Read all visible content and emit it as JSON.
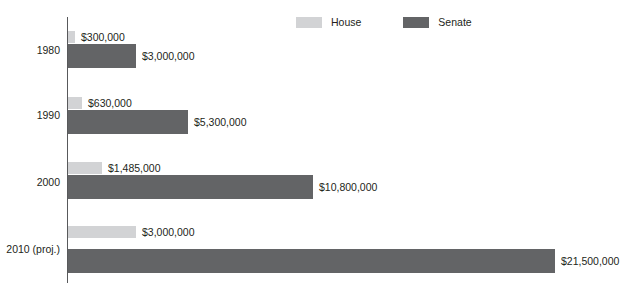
{
  "legend": {
    "position": "top-center",
    "entries": [
      {
        "label": "House",
        "color": "#d2d3d5",
        "swatch_name": "house-swatch"
      },
      {
        "label": "Senate",
        "color": "#636466",
        "swatch_name": "senate-swatch"
      }
    ]
  },
  "axis": {
    "line_color": "#58595b"
  },
  "colors": {
    "house": "#d2d3d5",
    "senate": "#636466",
    "text": "#231f20"
  },
  "chart_data": {
    "type": "bar",
    "orientation": "horizontal",
    "title": "",
    "subtitle": "",
    "xlabel": "",
    "ylabel": "",
    "grid": false,
    "legend_position": "top-center",
    "categories": [
      "1980",
      "1990",
      "2000",
      "2010 (proj.)"
    ],
    "series": [
      {
        "name": "House",
        "color": "#d2d3d5",
        "values": [
          300000,
          630000,
          1485000,
          3000000
        ],
        "value_labels": [
          "$300,000",
          "$630,000",
          "$1,485,000",
          "$3,000,000"
        ]
      },
      {
        "name": "Senate",
        "color": "#636466",
        "values": [
          3000000,
          5300000,
          10800000,
          21500000
        ],
        "value_labels": [
          "$3,000,000",
          "$5,300,000",
          "$10,800,000",
          "$21,500,000"
        ]
      }
    ],
    "xlim": [
      0,
      21500000
    ],
    "value_prefix": "$"
  },
  "groups": [
    {
      "category": "1980",
      "top": 30,
      "label_top": 44,
      "house": {
        "top": 31,
        "width": 7,
        "value": "$300,000"
      },
      "senate": {
        "top": 44,
        "width": 68,
        "value": "$3,000,000"
      }
    },
    {
      "category": "1990",
      "top": 99,
      "label_top": 109,
      "house": {
        "top": 97,
        "width": 14,
        "value": "$630,000"
      },
      "senate": {
        "top": 110,
        "width": 120,
        "value": "$5,300,000"
      }
    },
    {
      "category": "2000",
      "top": 162,
      "label_top": 176,
      "house": {
        "top": 162,
        "width": 34,
        "value": "$1,485,000"
      },
      "senate": {
        "top": 175,
        "width": 245,
        "value": "$10,800,000"
      }
    },
    {
      "category": "2010 (proj.)",
      "top": 226,
      "label_top": 243,
      "house": {
        "top": 226,
        "width": 68,
        "value": "$3,000,000"
      },
      "senate": {
        "top": 249,
        "width": 487,
        "value": "$21,500,000"
      }
    }
  ]
}
